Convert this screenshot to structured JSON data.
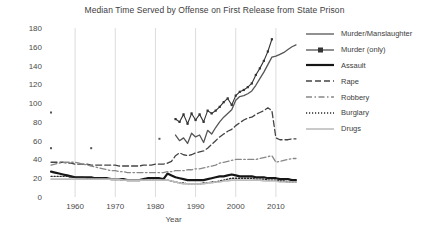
{
  "chart_data": {
    "type": "line",
    "title": "Median Time Served by Offense on First Release from State Prison",
    "xlabel": "Year",
    "ylabel": "",
    "xlim": [
      1953,
      2016
    ],
    "ylim": [
      0,
      180
    ],
    "xticks": [
      1960,
      1970,
      1980,
      1990,
      2000,
      2010
    ],
    "yticks": [
      0,
      20,
      40,
      60,
      80,
      100,
      120,
      140,
      160,
      180
    ],
    "grid": "vertical gridlines at x ticks, light gray",
    "legend_position": "right",
    "x": [
      1954,
      1955,
      1956,
      1957,
      1958,
      1959,
      1960,
      1961,
      1962,
      1963,
      1964,
      1965,
      1966,
      1967,
      1968,
      1969,
      1970,
      1971,
      1972,
      1973,
      1974,
      1975,
      1976,
      1977,
      1978,
      1979,
      1980,
      1981,
      1982,
      1983,
      1984,
      1985,
      1986,
      1987,
      1988,
      1989,
      1990,
      1991,
      1992,
      1993,
      1994,
      1995,
      1996,
      1997,
      1998,
      1999,
      2000,
      2001,
      2002,
      2003,
      2004,
      2005,
      2006,
      2007,
      2008,
      2009,
      2010,
      2011,
      2012,
      2013,
      2014,
      2015
    ],
    "series": [
      {
        "name": "Murder/Manslaughter",
        "style": "solid",
        "color": "#555555",
        "width": 1.3,
        "values": [
          null,
          null,
          null,
          null,
          null,
          null,
          null,
          null,
          null,
          null,
          null,
          null,
          null,
          null,
          null,
          null,
          null,
          null,
          null,
          null,
          null,
          null,
          null,
          null,
          null,
          null,
          null,
          null,
          null,
          null,
          null,
          66,
          60,
          63,
          57,
          68,
          64,
          66,
          58,
          71,
          67,
          74,
          80,
          85,
          89,
          93,
          103,
          107,
          108,
          110,
          113,
          119,
          126,
          133,
          141,
          149,
          150,
          152,
          154,
          157,
          160,
          162
        ]
      },
      {
        "name": "Murder (only)",
        "style": "solid-marker",
        "color": "#333333",
        "width": 1.1,
        "values": [
          null,
          null,
          null,
          null,
          null,
          null,
          null,
          null,
          null,
          null,
          null,
          null,
          null,
          null,
          null,
          null,
          null,
          null,
          null,
          null,
          null,
          null,
          null,
          null,
          null,
          null,
          null,
          null,
          null,
          null,
          null,
          83,
          80,
          88,
          78,
          89,
          82,
          88,
          80,
          92,
          89,
          92,
          96,
          101,
          105,
          98,
          108,
          112,
          114,
          117,
          121,
          130,
          137,
          145,
          155,
          168,
          null,
          null,
          null,
          null,
          null,
          null
        ]
      },
      {
        "name": "Assault",
        "style": "solid",
        "color": "#161616",
        "width": 2.2,
        "values": [
          27,
          26,
          25,
          24,
          23,
          22,
          21,
          21,
          21,
          21,
          21,
          20,
          20,
          20,
          20,
          19,
          19,
          19,
          19,
          18,
          18,
          18,
          18,
          19,
          20,
          20,
          20,
          20,
          19,
          25,
          23,
          21,
          20,
          19,
          18,
          18,
          18,
          18,
          18,
          19,
          20,
          21,
          22,
          22,
          23,
          24,
          23,
          22,
          22,
          22,
          22,
          21,
          21,
          21,
          20,
          20,
          20,
          19,
          19,
          19,
          18,
          18
        ]
      },
      {
        "name": "Rape",
        "style": "dashed",
        "color": "#444444",
        "width": 1.3,
        "values": [
          37,
          37,
          37,
          37,
          36,
          36,
          35,
          35,
          35,
          35,
          34,
          34,
          34,
          34,
          34,
          34,
          34,
          33,
          33,
          33,
          33,
          33,
          33,
          34,
          34,
          34,
          35,
          35,
          35,
          36,
          38,
          44,
          47,
          45,
          44,
          45,
          47,
          48,
          49,
          52,
          56,
          60,
          64,
          67,
          70,
          72,
          76,
          79,
          82,
          84,
          85,
          88,
          90,
          92,
          95,
          92,
          63,
          61,
          61,
          61,
          62,
          62
        ]
      },
      {
        "name": "Robbery",
        "style": "dashdot",
        "color": "#888888",
        "width": 1.3,
        "values": [
          34,
          35,
          36,
          37,
          37,
          37,
          37,
          36,
          35,
          34,
          33,
          32,
          31,
          30,
          29,
          28,
          28,
          27,
          27,
          26,
          26,
          26,
          26,
          26,
          26,
          26,
          26,
          26,
          26,
          27,
          27,
          28,
          28,
          28,
          29,
          29,
          30,
          30,
          31,
          32,
          33,
          34,
          36,
          37,
          38,
          39,
          40,
          40,
          40,
          40,
          40,
          40,
          41,
          42,
          43,
          44,
          37,
          38,
          39,
          40,
          41,
          41
        ]
      },
      {
        "name": "Burglary",
        "style": "dotted",
        "color": "#2a2a2a",
        "width": 1.4,
        "values": [
          22,
          22,
          22,
          22,
          22,
          21,
          21,
          21,
          21,
          20,
          20,
          20,
          20,
          20,
          19,
          19,
          19,
          19,
          18,
          18,
          18,
          18,
          18,
          18,
          18,
          18,
          18,
          18,
          18,
          18,
          17,
          16,
          15,
          15,
          14,
          14,
          14,
          14,
          15,
          15,
          16,
          16,
          17,
          18,
          19,
          20,
          20,
          20,
          20,
          20,
          20,
          19,
          19,
          19,
          18,
          18,
          18,
          17,
          17,
          16,
          16,
          16
        ]
      },
      {
        "name": "Drugs",
        "style": "solid",
        "color": "#bdbdbd",
        "width": 1.6,
        "values": [
          19,
          19,
          19,
          19,
          19,
          19,
          19,
          19,
          19,
          19,
          19,
          19,
          19,
          19,
          19,
          19,
          19,
          19,
          18,
          18,
          18,
          18,
          18,
          18,
          18,
          18,
          18,
          18,
          18,
          18,
          17,
          16,
          15,
          14,
          14,
          14,
          14,
          14,
          14,
          15,
          15,
          16,
          16,
          17,
          17,
          18,
          18,
          18,
          18,
          18,
          18,
          18,
          18,
          17,
          17,
          17,
          17,
          16,
          16,
          16,
          16,
          16
        ]
      }
    ],
    "stray_points": [
      {
        "x": 1954,
        "y": 90,
        "note": "isolated marker near left axis"
      },
      {
        "x": 1954,
        "y": 52,
        "note": "isolated marker near left axis"
      },
      {
        "x": 1964,
        "y": 52,
        "note": "isolated marker"
      },
      {
        "x": 1981,
        "y": 62,
        "note": "isolated marker"
      }
    ]
  },
  "legend": {
    "items": [
      {
        "label": "Murder/Manslaughter"
      },
      {
        "label": "Murder (only)"
      },
      {
        "label": "Assault"
      },
      {
        "label": "Rape"
      },
      {
        "label": "Robbery"
      },
      {
        "label": "Burglary"
      },
      {
        "label": "Drugs"
      }
    ]
  }
}
